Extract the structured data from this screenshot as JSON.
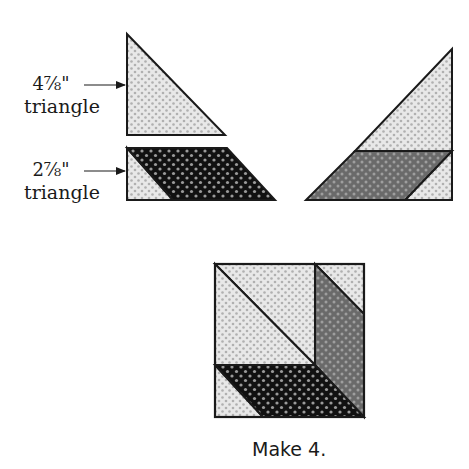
{
  "diagram": {
    "labels": {
      "large_triangle_size": "4⅞\"",
      "large_triangle_word": "triangle",
      "small_triangle_size": "2⅞\"",
      "small_triangle_word": "triangle"
    },
    "caption": "Make 4.",
    "fabrics": {
      "light": "#e6e6e6",
      "light_dot": "#b5b5b5",
      "dark": "#111111",
      "dark_dot": "#9a9a9a",
      "medium": "#6e6e6e",
      "medium_dot": "#a8a8a8",
      "outline": "#1a1a1a"
    },
    "pieces": [
      {
        "id": "large-light-triangle",
        "fabric": "light"
      },
      {
        "id": "small-light-triangle",
        "fabric": "light"
      },
      {
        "id": "dark-parallelogram",
        "fabric": "dark"
      },
      {
        "id": "assembled-large-triangle",
        "fabric": "light"
      },
      {
        "id": "assembled-medium-parallelogram",
        "fabric": "medium"
      },
      {
        "id": "finished-block",
        "count": 4
      }
    ]
  }
}
